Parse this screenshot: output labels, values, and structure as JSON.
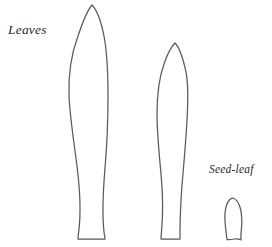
{
  "figure": {
    "background_color": "#ffffff",
    "stroke_color": "#5a5a5a",
    "width": 272,
    "height": 247
  },
  "labels": {
    "leaves": "Leaves",
    "seed_leaf": "Seed-leaf"
  },
  "specimens": [
    {
      "name": "leaf-large",
      "label": "Leaves",
      "outline": "M 92,5 C 96,9 101,21 104,36 C 107,52 108,74 108,96 C 108,120 107,145 105,168 C 103,192 102,214 104,232 C 104.6,236 105,238 105,239 L 78,239 C 78,237.5 78.2,235 78.8,231 C 81,213 80,190 77,166 C 74,142 70,118 69,96 C 68.3,74 72,52 78,36 C 83,21 88.5,9 92,5 Z"
    },
    {
      "name": "leaf-medium",
      "label": "Leaves",
      "outline": "M 175,43 C 179,47 183,58 186,72 C 188.5,85 188,103 187,120 C 186,140 184,162 182,185 C 180.5,205 180,224 180,235 C 180,237.5 180,238.6 180,239 L 161,239 C 161,238.2 161,236.6 161.4,233 C 163,216 163,195 161,174 C 159,152 157,132 157,114 C 157,97 159,78 164,64 C 168,52 172,46 175,43 Z"
    },
    {
      "name": "seed-leaf",
      "label": "Seed-leaf",
      "outline": "M 233,198 C 236,199 239,203 240.5,209 C 242,215 242,222 241.5,228 C 241,233 240.8,237 241,239.8 C 239,239 237,238.6 234.5,239 C 232,239.5 229.5,240 227,239.6 C 226.4,236 226,231 225.4,226 C 224.6,219 224.6,211 226.6,205 C 228.2,200.6 230.6,198 233,198 Z"
    }
  ]
}
